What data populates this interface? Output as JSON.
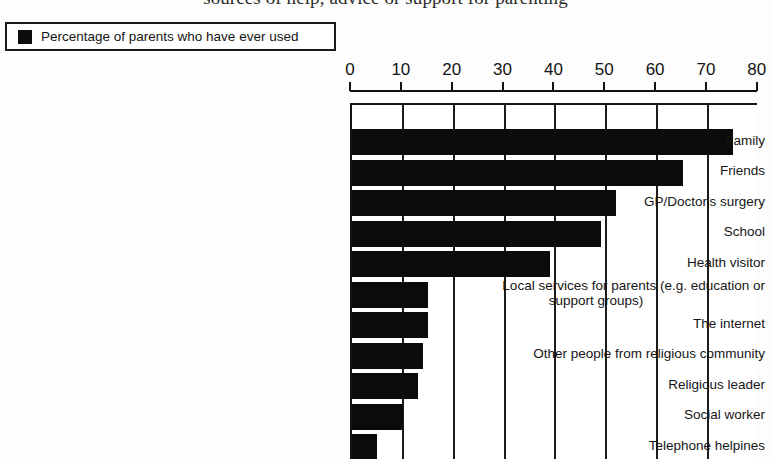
{
  "chart_title": "sources of help, advice or support for parenting",
  "legend": {
    "label": "Percentage of parents who have ever used",
    "swatch_color": "#0b0b0b",
    "swatch_icon": "filled-square-icon"
  },
  "axis": {
    "x_ticks": [
      "0",
      "10",
      "20",
      "30",
      "40",
      "50",
      "60",
      "70",
      "80"
    ]
  },
  "chart_data": {
    "type": "bar",
    "orientation": "horizontal",
    "title": "sources of help, advice or support for parenting",
    "xlabel": "",
    "ylabel": "",
    "xlim": [
      0,
      80
    ],
    "xticks": [
      0,
      10,
      20,
      30,
      40,
      50,
      60,
      70,
      80
    ],
    "grid": true,
    "legend_position": "top-left",
    "series": [
      {
        "name": "Percentage of parents who have ever used",
        "color": "#0b0b0b",
        "values": [
          75,
          65,
          52,
          49,
          39,
          15,
          15,
          14,
          13,
          10,
          5
        ]
      }
    ],
    "categories": [
      "Family",
      "Friends",
      "GP/Doctor's surgery",
      "School",
      "Health visitor",
      "Local services for parents (e.g. education or support groups)",
      "The internet",
      "Other people from religious community",
      "Religious leader",
      "Social worker",
      "Telephone helpines"
    ],
    "note": "bottom bar is cropped by the image edge"
  },
  "categories_display": [
    {
      "line1": "Family",
      "line2": ""
    },
    {
      "line1": "Friends",
      "line2": ""
    },
    {
      "line1": "GP/Doctor's surgery",
      "line2": ""
    },
    {
      "line1": "School",
      "line2": ""
    },
    {
      "line1": "Health visitor",
      "line2": ""
    },
    {
      "line1": "Local services for parents (e.g. education or",
      "line2": "support groups)"
    },
    {
      "line1": "The internet",
      "line2": ""
    },
    {
      "line1": "Other people from religious community",
      "line2": ""
    },
    {
      "line1": "Religious leader",
      "line2": ""
    },
    {
      "line1": "Social worker",
      "line2": ""
    },
    {
      "line1": "Telephone helpines",
      "line2": ""
    }
  ]
}
